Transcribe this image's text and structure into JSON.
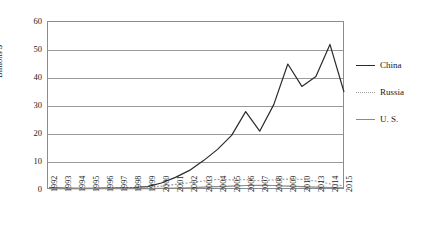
{
  "chart_data": {
    "type": "line",
    "title": "",
    "xlabel": "",
    "ylabel": "Billions $",
    "ylim": [
      0,
      60
    ],
    "yticks": [
      0,
      10,
      20,
      30,
      40,
      50,
      60
    ],
    "grid": true,
    "legend_position": "right",
    "categories": [
      "1992",
      "1993",
      "1994",
      "1995",
      "1996",
      "1997",
      "1998",
      "1999",
      "2000",
      "2001",
      "2002",
      "2003",
      "2004",
      "2005",
      "2006",
      "2007",
      "2008",
      "2009",
      "2010",
      "2013",
      "2014",
      "2015"
    ],
    "series": [
      {
        "name": "China",
        "style": "solid",
        "color": "#2b2b2b",
        "values": [
          0.8,
          0.7,
          0.6,
          0.6,
          0.7,
          0.8,
          0.9,
          1.2,
          2.5,
          4.5,
          7.0,
          10.5,
          14.5,
          19.5,
          28.0,
          21.0,
          30.5,
          45.0,
          37.0,
          40.5,
          52.0,
          35.0
        ]
      },
      {
        "name": "Russia",
        "style": "dotted",
        "color": "#9b9b9b",
        "values": [
          0.5,
          0.5,
          0.5,
          0.6,
          0.7,
          0.8,
          0.8,
          1.0,
          1.4,
          2.0,
          2.6,
          3.2,
          3.8,
          3.6,
          3.7,
          3.3,
          3.6,
          3.9,
          3.8,
          3.2,
          2.2,
          1.5
        ]
      },
      {
        "name": "U. S.",
        "style": "solid",
        "color": "#8a8a8a",
        "values": [
          0.6,
          0.5,
          0.5,
          0.5,
          0.5,
          0.5,
          0.5,
          0.5,
          0.6,
          0.7,
          0.8,
          1.0,
          1.2,
          1.4,
          1.6,
          1.7,
          1.6,
          1.4,
          1.2,
          1.0,
          0.9,
          0.8
        ]
      }
    ],
    "legend": [
      {
        "label": "China",
        "style": "solid",
        "color": "#2b2b2b"
      },
      {
        "label": "Russia",
        "style": "dotted",
        "color": "#9b9b9b"
      },
      {
        "label": "U. S.",
        "style": "solid",
        "color": "#8a8a8a"
      }
    ]
  }
}
